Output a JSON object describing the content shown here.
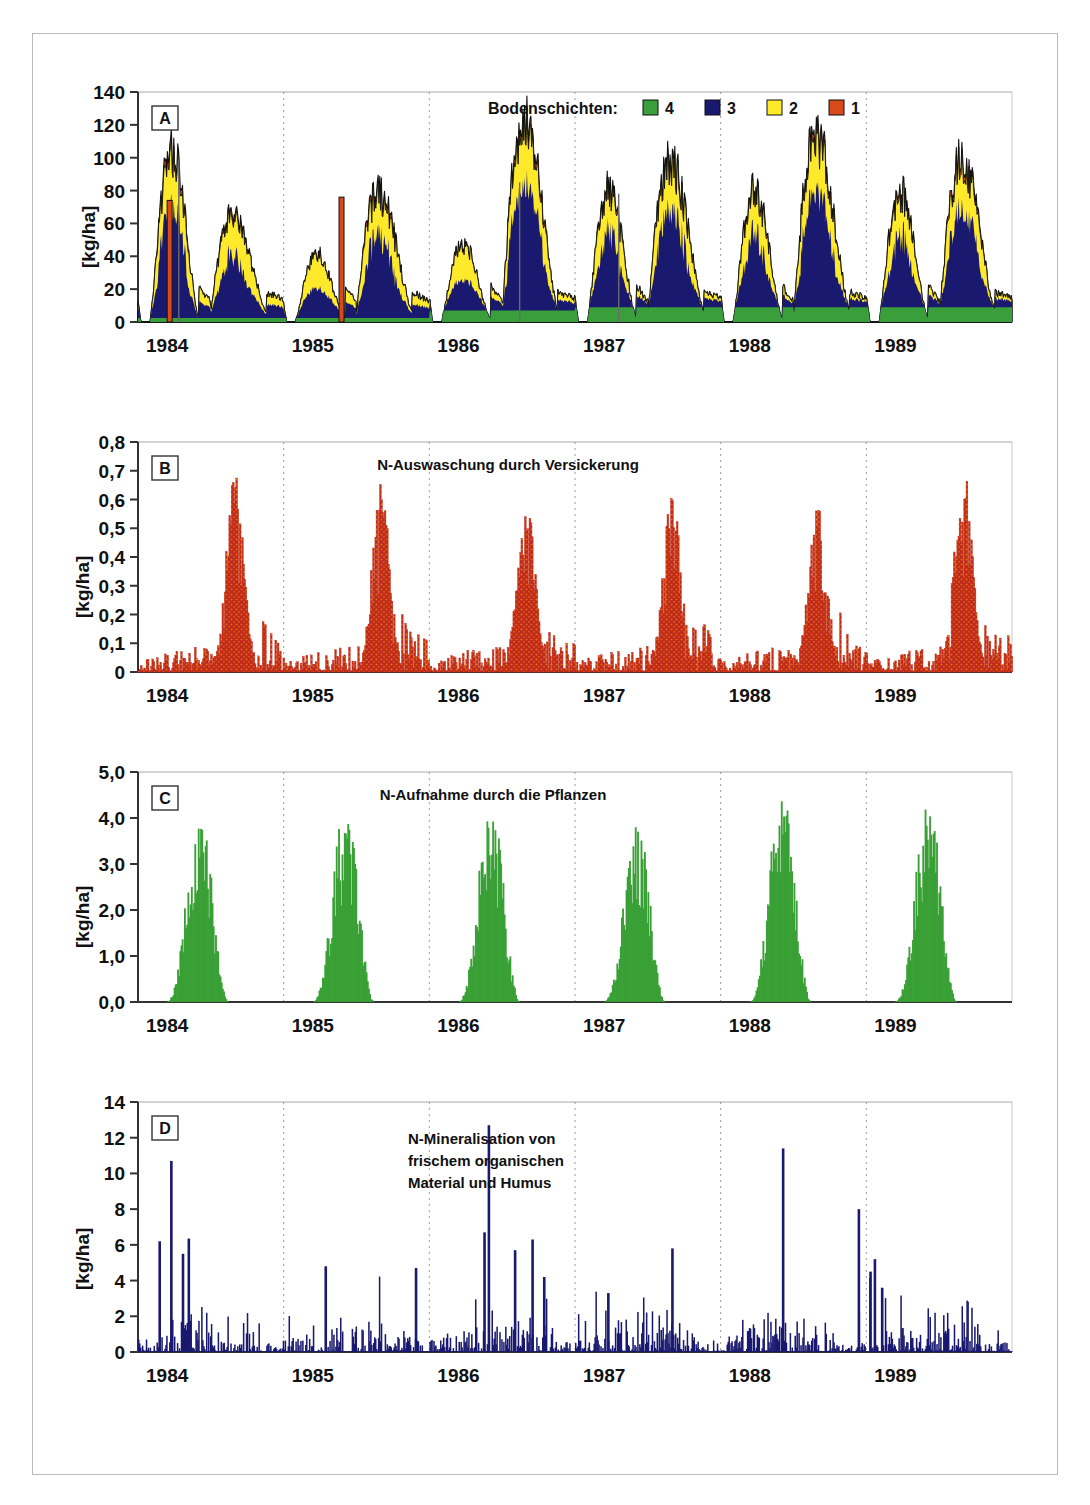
{
  "figure": {
    "units_label": "[kg/ha]",
    "x_years": [
      "1984",
      "1985",
      "1986",
      "1987",
      "1988",
      "1989"
    ],
    "colors": {
      "layer4": "#3a9e3a",
      "layer3": "#191970",
      "layer2": "#ffe92b",
      "layer1": "#d94a1a",
      "leaching": "#c0281e",
      "leaching_speckle": "#e8820c",
      "uptake": "#39a035",
      "mineralisation": "#191970",
      "outline": "#111111",
      "grid": "#9a9a9a",
      "axis": "#333333",
      "frame": "#b9b9b9"
    },
    "legend": {
      "title": "Bodenschichten:",
      "entries": [
        {
          "label": "4",
          "color": "#3a9e3a"
        },
        {
          "label": "3",
          "color": "#191970"
        },
        {
          "label": "2",
          "color": "#ffe92b"
        },
        {
          "label": "1",
          "color": "#d94a1a"
        }
      ]
    }
  },
  "chart_data": [
    {
      "id": "A",
      "type": "area",
      "panel_label": "A",
      "title": "",
      "ylabel": "[kg/ha]",
      "xlabel": "",
      "ylim": [
        0,
        140
      ],
      "yticks": [
        0,
        20,
        40,
        60,
        80,
        100,
        120,
        140
      ],
      "ytick_labels": [
        "0",
        "20",
        "40",
        "60",
        "80",
        "100",
        "120",
        "140"
      ],
      "xlim": [
        1984.0,
        1990.0
      ],
      "xticks": [
        1984,
        1985,
        1986,
        1987,
        1988,
        1989
      ],
      "grid": "vertical-dashed-at-years",
      "legend_position": "top-center",
      "stacked": true,
      "series_order": [
        "layer4",
        "layer3",
        "layer2",
        "layer1"
      ],
      "series": [
        {
          "name": "4",
          "color": "#3a9e3a",
          "description": "Bodenschicht 4 (deepest), baseline band ~2-10 kg/ha"
        },
        {
          "name": "3",
          "color": "#191970",
          "description": "Bodenschicht 3, dominant mass of each seasonal peak"
        },
        {
          "name": "2",
          "color": "#ffe92b",
          "description": "Bodenschicht 2, mid layer of peaks"
        },
        {
          "name": "1",
          "color": "#d94a1a",
          "description": "Bodenschicht 1 (surface), thin top caps and spikes"
        }
      ],
      "annual_peaks_total": [
        110,
        42,
        48,
        124,
        84,
        82,
        97,
        87,
        112
      ],
      "notes": "Two seasonal maxima per year; spring fertilisation spikes reach ~74 (1984), ~76 (1985) as narrow orange/grey bars."
    },
    {
      "id": "B",
      "type": "area",
      "panel_label": "B",
      "title": "N-Auswaschung durch Versickerung",
      "ylabel": "[kg/ha]",
      "xlabel": "",
      "ylim": [
        0,
        0.8
      ],
      "yticks": [
        0,
        0.1,
        0.2,
        0.3,
        0.4,
        0.5,
        0.6,
        0.7,
        0.8
      ],
      "ytick_labels": [
        "0",
        "0,1",
        "0,2",
        "0,3",
        "0,4",
        "0,5",
        "0,6",
        "0,7",
        "0,8"
      ],
      "xlim": [
        1984.0,
        1990.0
      ],
      "xticks": [
        1984,
        1985,
        1986,
        1987,
        1988,
        1989
      ],
      "grid": "vertical-dashed-at-years",
      "series": [
        {
          "name": "N-Auswaschung",
          "color": "#c0281e"
        }
      ],
      "annual_max": [
        0.69,
        0.67,
        0.6,
        0.62,
        0.61,
        0.75
      ],
      "notes": "Winter leaching maxima just before each year boundary; summer background 0.02-0.12 kg/ha."
    },
    {
      "id": "C",
      "type": "area",
      "panel_label": "C",
      "title": "N-Aufnahme durch die Pflanzen",
      "ylabel": "[kg/ha]",
      "xlabel": "",
      "ylim": [
        0,
        5.0
      ],
      "yticks": [
        0,
        1.0,
        2.0,
        3.0,
        4.0,
        5.0
      ],
      "ytick_labels": [
        "0,0",
        "1,0",
        "2,0",
        "3,0",
        "4,0",
        "5,0"
      ],
      "xlim": [
        1984.0,
        1990.0
      ],
      "xticks": [
        1984,
        1985,
        1986,
        1987,
        1988,
        1989
      ],
      "grid": "vertical-dashed-at-years",
      "series": [
        {
          "name": "N-Aufnahme",
          "color": "#39a035"
        }
      ],
      "annual_max": [
        3.95,
        3.9,
        4.05,
        3.8,
        4.4,
        4.25
      ],
      "notes": "One growing-season peak per year, roughly May-August; zero in winter."
    },
    {
      "id": "D",
      "type": "bar",
      "panel_label": "D",
      "title": "N-Mineralisation von frischem organischen Material und Humus",
      "title_lines": [
        "N-Mineralisation von",
        "frischem organischen",
        "Material und Humus"
      ],
      "ylabel": "[kg/ha]",
      "xlabel": "",
      "ylim": [
        0,
        14
      ],
      "yticks": [
        0,
        2,
        4,
        6,
        8,
        10,
        12,
        14
      ],
      "ytick_labels": [
        "0",
        "2",
        "4",
        "6",
        "8",
        "10",
        "12",
        "14"
      ],
      "xlim": [
        1984.0,
        1990.0
      ],
      "xticks": [
        1984,
        1985,
        1986,
        1987,
        1988,
        1989
      ],
      "grid": "vertical-dashed-at-years",
      "series": [
        {
          "name": "N-Mineralisation",
          "color": "#191970"
        }
      ],
      "annual_max": [
        10.7,
        4.8,
        12.7,
        6.3,
        11.4,
        8.0
      ],
      "notes": "Spiky daily event series; most values below 2 kg/ha with isolated spikes 4-13 kg/ha."
    }
  ]
}
